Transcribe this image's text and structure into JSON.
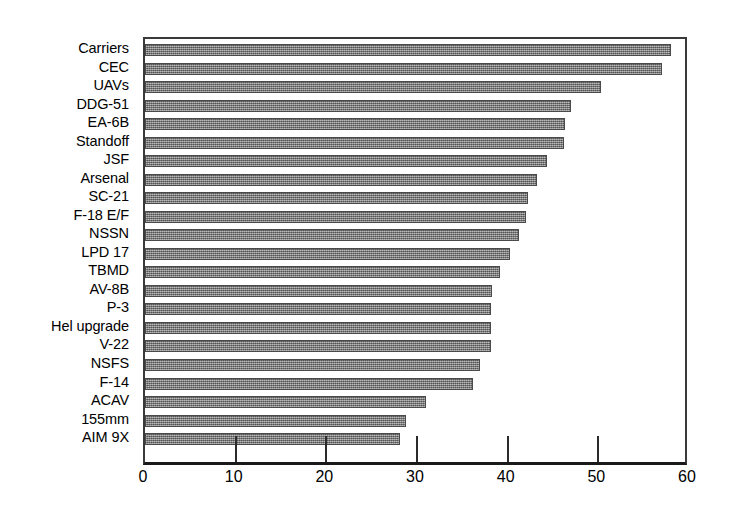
{
  "chart_data": {
    "type": "bar",
    "orientation": "horizontal",
    "title": "",
    "subtitle": "",
    "xlabel": "",
    "ylabel": "",
    "xlim": [
      0,
      60
    ],
    "ylim": null,
    "grid": false,
    "legend": null,
    "xticks": [
      0,
      10,
      20,
      30,
      40,
      50,
      60
    ],
    "xtick_labels": [
      "0",
      "10",
      "20",
      "30",
      "40",
      "50",
      "60"
    ],
    "categories": [
      "Carriers",
      "CEC",
      "UAVs",
      "DDG-51",
      "EA-6B",
      "Standoff",
      "JSF",
      "Arsenal",
      "SC-21",
      "F-18 E/F",
      "NSSN",
      "LPD 17",
      "TBMD",
      "AV-8B",
      "P-3",
      "Hel upgrade",
      "V-22",
      "NSFS",
      "F-14",
      "ACAV",
      "155mm",
      "AIM 9X"
    ],
    "values": [
      58.0,
      57.0,
      50.3,
      47.0,
      46.3,
      46.2,
      44.3,
      43.2,
      42.2,
      42.0,
      41.3,
      40.3,
      39.2,
      38.3,
      38.2,
      38.2,
      38.2,
      37.0,
      36.2,
      31.0,
      28.8,
      28.1
    ],
    "series": [
      {
        "name": "",
        "values": [
          58.0,
          57.0,
          50.3,
          47.0,
          46.3,
          46.2,
          44.3,
          43.2,
          42.2,
          42.0,
          41.3,
          40.3,
          39.2,
          38.3,
          38.2,
          38.2,
          38.2,
          37.0,
          36.2,
          31.0,
          28.8,
          28.1
        ]
      }
    ],
    "bar_color": "#7d7d7d",
    "bar_edge_color": "#4a4a4a",
    "axis_color": "#2b2b2b",
    "background_color": "#ffffff"
  }
}
